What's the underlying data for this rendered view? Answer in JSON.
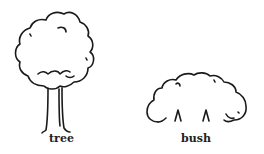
{
  "figures": [
    {
      "id": "tree",
      "label": "tree"
    },
    {
      "id": "bush",
      "label": "bush"
    }
  ],
  "colors": {
    "stroke": "#1a1a1a",
    "background": "#ffffff"
  }
}
